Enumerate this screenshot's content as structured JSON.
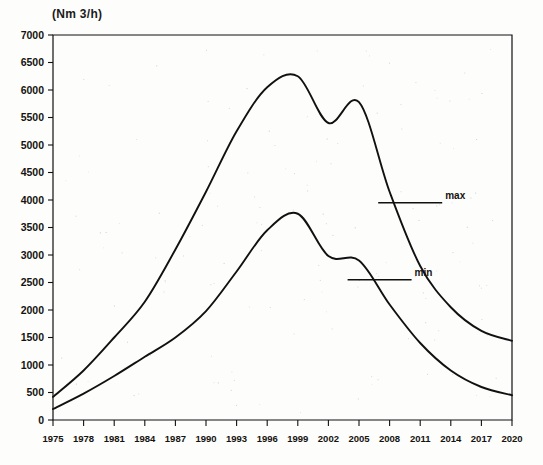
{
  "chart_data": {
    "type": "line",
    "title": "(Nm 3/h)",
    "xlabel": "",
    "ylabel": "(Nm 3/h)",
    "xlim": [
      1975,
      2020
    ],
    "ylim": [
      0,
      7000
    ],
    "grid": false,
    "legend_position": "inline-annotation",
    "x_tick_labels": [
      "1975",
      "1978",
      "1981",
      "1984",
      "1987",
      "1990",
      "1993",
      "1996",
      "1999",
      "2002",
      "2005",
      "2008",
      "2011",
      "2014",
      "2017",
      "2020"
    ],
    "y_tick_labels": [
      "0",
      "500",
      "1000",
      "1500",
      "2000",
      "2500",
      "3000",
      "3500",
      "4000",
      "4500",
      "5000",
      "5500",
      "6000",
      "6500",
      "7000"
    ],
    "x_ticks": [
      1975,
      1978,
      1981,
      1984,
      1987,
      1990,
      1993,
      1996,
      1999,
      2002,
      2005,
      2008,
      2011,
      2014,
      2017,
      2020
    ],
    "y_ticks": [
      0,
      500,
      1000,
      1500,
      2000,
      2500,
      3000,
      3500,
      4000,
      4500,
      5000,
      5500,
      6000,
      6500,
      7000
    ],
    "x": [
      1975,
      1978,
      1981,
      1984,
      1987,
      1990,
      1993,
      1996,
      1999,
      2002,
      2005,
      2008,
      2011,
      2014,
      2017,
      2020
    ],
    "series": [
      {
        "name": "max",
        "color": "#111111",
        "values": [
          420,
          900,
          1500,
          2150,
          3100,
          4150,
          5250,
          6050,
          6250,
          5400,
          5780,
          4150,
          2800,
          2050,
          1620,
          1440
        ]
      },
      {
        "name": "min",
        "color": "#111111",
        "values": [
          200,
          480,
          800,
          1150,
          1500,
          1980,
          2700,
          3450,
          3750,
          2980,
          2900,
          2100,
          1400,
          900,
          600,
          450
        ]
      }
    ],
    "annotations": [
      {
        "text": "max",
        "x": 2011,
        "y": 3950
      },
      {
        "text": "min",
        "x": 2008,
        "y": 2550
      }
    ]
  },
  "legend": {
    "max_label": "max",
    "min_label": "min"
  }
}
